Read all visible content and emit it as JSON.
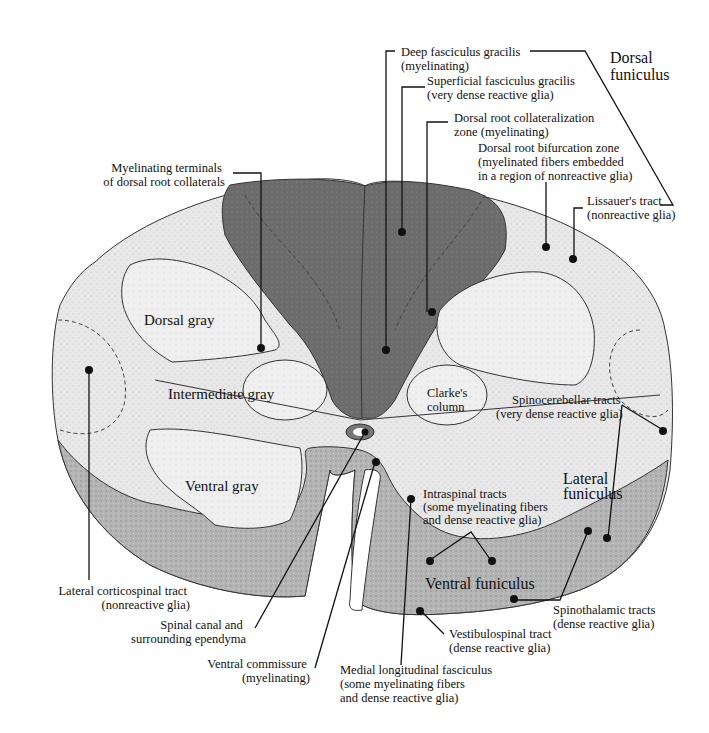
{
  "figure": {
    "colors": {
      "background": "#ffffff",
      "white_matter_light": "#e6e6e6",
      "gray_matter_light": "#ececec",
      "dorsal_column_dark": "#6e6e6e",
      "ventral_funiculus": "#a8a8a8",
      "line": "#111111"
    }
  },
  "labels": {
    "dorsal_funiculus": [
      "Dorsal",
      "funiculus"
    ],
    "deep_fasciculus_gracilis": [
      "Deep fasciculus gracilis",
      "(myelinating)"
    ],
    "superficial_fasciculus_gracilis": [
      "Superficial fasciculus gracilis",
      "(very dense reactive glia)"
    ],
    "dorsal_root_collateralization": [
      "Dorsal root collateralization",
      "zone (myelinating)"
    ],
    "dorsal_root_bifurcation": [
      "Dorsal root bifurcation zone",
      "(myelinated fibers embedded",
      "in a region of nonreactive glia)"
    ],
    "lissauers_tract": [
      "Lissauer's tract",
      "(nonreactive glia)"
    ],
    "myelinating_terminals": [
      "Myelinating terminals",
      "of dorsal root collaterals"
    ],
    "dorsal_gray": "Dorsal gray",
    "intermediate_gray": "Intermediate gray",
    "clarkes_column": [
      "Clarke's",
      "column"
    ],
    "spinocerebellar_tracts": [
      "Spinocerebellar tracts",
      "(very dense reactive glia)"
    ],
    "ventral_gray": "Ventral gray",
    "lateral_funiculus": [
      "Lateral",
      "funiculus"
    ],
    "intraspinal_tracts": [
      "Intraspinal tracts",
      "(some myelinating fibers",
      "and dense reactive glia)"
    ],
    "ventral_funiculus": "Ventral funiculus",
    "lateral_corticospinal_tract": [
      "Lateral corticospinal tract",
      "(nonreactive glia)"
    ],
    "spinal_canal": [
      "Spinal canal and",
      "surrounding ependyma"
    ],
    "ventral_commissure": [
      "Ventral commissure",
      "(myelinating)"
    ],
    "medial_longitudinal_fasciculus": [
      "Medial longitudinal fasciculus",
      "(some myelinating fibers",
      "and dense reactive glia)"
    ],
    "vestibulospinal_tract": [
      "Vestibulospinal tract",
      "(dense reactive glia)"
    ],
    "spinothalamic_tracts": [
      "Spinothalamic tracts",
      "(dense reactive glia)"
    ]
  }
}
